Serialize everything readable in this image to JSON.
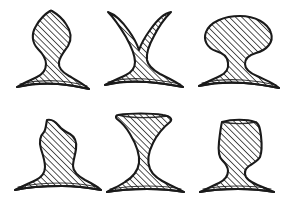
{
  "page": {
    "background_color": "#ffffff",
    "width": 285,
    "height": 200,
    "style": "ink sketch, diagonal hatch fill"
  },
  "style_tokens": {
    "outline_color": "#1a1a1a",
    "hatch_color": "#2b2b2b",
    "fill_color": "#ffffff",
    "outline_width": 2.0,
    "hatch_width": 0.9,
    "hatch_spacing": 3.1,
    "hatch_angle_deg": 45
  },
  "grid": {
    "rows": 2,
    "columns": 3,
    "cell_width": 95,
    "cell_height": 100
  },
  "shapes": [
    {
      "index": 1,
      "name": "onion-dome-pedestal",
      "label": "Onion dome on flared base",
      "row": 1,
      "column": 1,
      "cell_origin": [
        0,
        0
      ],
      "path": "M 56 12 C 60 18 67 22 70 30 C 74 40 70 48 64 53 C 60 57 58 60 58 66 C 58 71 62 74 68 77 C 76 81 84 84 88 88 C 80 87 70 85 58 84 C 44 83 30 84 18 86 C 24 82 32 79 38 76 C 44 73 47 70 47 65 C 47 59 44 56 39 52 C 32 46 29 38 33 29 C 37 21 45 18 50 12 C 52 9 54 9 56 12 Z"
    },
    {
      "index": 2,
      "name": "double-horn-cross",
      "label": "Two-horned cross / X form",
      "row": 1,
      "column": 2,
      "cell_origin": [
        95,
        0
      ],
      "path": "M 110 13 C 116 14 124 21 131 30 C 136 37 139 44 140 50 C 141 44 144 37 149 30 C 156 21 164 14 170 13 C 166 18 160 26 155 35 C 150 44 147 52 147 59 C 147 65 151 69 158 73 C 166 78 176 81 182 85 C 172 84 160 82 148 81 C 134 80 120 81 108 84 C 114 80 122 77 128 74 C 134 71 137 67 137 61 C 137 54 134 46 129 37 C 124 28 117 19 110 13 Z"
    },
    {
      "index": 3,
      "name": "mushroom-cap-pedestal",
      "label": "Wide rounded cap on base",
      "row": 1,
      "column": 3,
      "cell_origin": [
        190,
        0
      ],
      "path": "M 243 17 C 256 17 268 23 271 32 C 274 41 268 49 258 52 C 251 54 247 58 247 64 C 247 69 251 73 258 76 C 266 79 274 82 278 86 C 268 85 256 83 244 82 C 228 81 212 82 200 85 C 206 81 214 78 220 75 C 226 72 229 68 229 63 C 229 57 225 53 218 51 C 209 48 204 41 206 33 C 209 23 220 17 233 16 C 236 16 240 17 243 17 Z"
    },
    {
      "index": 4,
      "name": "bumpy-dome-pedestal",
      "label": "Bumpy rounded dome on base",
      "row": 2,
      "column": 1,
      "cell_origin": [
        0,
        100
      ]
    },
    {
      "index": 5,
      "name": "hourglass-spool",
      "label": "Hourglass / spool with flat top",
      "row": 2,
      "column": 2,
      "cell_origin": [
        95,
        100
      ]
    },
    {
      "index": 6,
      "name": "trapezoid-top-pedestal",
      "label": "Trapezoidal top with narrow waist",
      "row": 2,
      "column": 3,
      "cell_origin": [
        190,
        100
      ]
    }
  ]
}
